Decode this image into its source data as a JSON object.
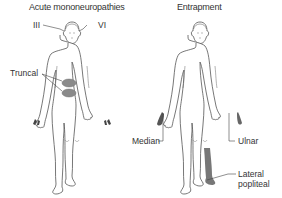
{
  "panels": [
    {
      "title": "Acute mononeuropathies",
      "labels": {
        "cn3": "III",
        "cn6": "VI",
        "truncal": "Truncal"
      },
      "shading_color": "#8a8a8a"
    },
    {
      "title": "Entrapment",
      "labels": {
        "median": "Median",
        "ulnar": "Ulnar",
        "lateral_popliteal_line1": "Lateral",
        "lateral_popliteal_line2": "popliteal"
      },
      "shading_color": "#6e6e6e"
    }
  ],
  "colors": {
    "outline": "#555555",
    "body_fill": "#ffffff",
    "leader_line": "#444444"
  }
}
